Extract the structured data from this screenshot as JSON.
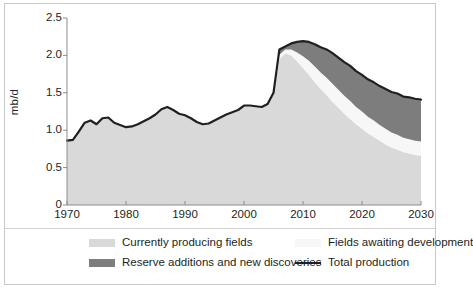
{
  "chart_data": {
    "type": "area",
    "stacked": true,
    "title": "",
    "xlabel": "",
    "ylabel": "mb/d",
    "xlim": [
      1970,
      2030
    ],
    "ylim": [
      0,
      2.5
    ],
    "xticks": [
      1970,
      1980,
      1990,
      2000,
      2010,
      2020,
      2030
    ],
    "xtick_labels": [
      "1970",
      "1980",
      "1990",
      "2000",
      "2010",
      "2020",
      "2030"
    ],
    "yticks": [
      0,
      0.5,
      1.0,
      1.5,
      2.0,
      2.5
    ],
    "ytick_labels": [
      "0",
      "0.5",
      "1.0",
      "1.5",
      "2.0",
      "2.5"
    ],
    "grid": false,
    "legend_position": "bottom",
    "colors": {
      "currently_producing_fields": "#d9d9d9",
      "fields_awaiting_development": "#f7f7f7",
      "reserve_additions_and_new_discoveries": "#7d7d7d",
      "total_production_line": "#231f20",
      "axis": "#8c8c8c",
      "frame": "#c9c9c9",
      "background": "#ffffff"
    },
    "x": [
      1970,
      1971,
      1972,
      1973,
      1974,
      1975,
      1976,
      1977,
      1978,
      1979,
      1980,
      1981,
      1982,
      1983,
      1984,
      1985,
      1986,
      1987,
      1988,
      1989,
      1990,
      1991,
      1992,
      1993,
      1994,
      1995,
      1996,
      1997,
      1998,
      1999,
      2000,
      2001,
      2002,
      2003,
      2004,
      2005,
      2006,
      2007,
      2008,
      2009,
      2010,
      2011,
      2012,
      2013,
      2014,
      2015,
      2016,
      2017,
      2018,
      2019,
      2020,
      2021,
      2022,
      2023,
      2024,
      2025,
      2026,
      2027,
      2028,
      2029,
      2030
    ],
    "series": [
      {
        "name": "Currently producing fields",
        "key": "currently_producing_fields",
        "color": "#d9d9d9",
        "values": [
          0.86,
          0.87,
          0.98,
          1.1,
          1.13,
          1.08,
          1.16,
          1.17,
          1.1,
          1.07,
          1.04,
          1.05,
          1.08,
          1.12,
          1.16,
          1.21,
          1.28,
          1.31,
          1.27,
          1.22,
          1.2,
          1.16,
          1.11,
          1.08,
          1.09,
          1.13,
          1.17,
          1.21,
          1.24,
          1.27,
          1.33,
          1.33,
          1.32,
          1.31,
          1.35,
          1.47,
          1.95,
          2.03,
          2.0,
          1.92,
          1.83,
          1.74,
          1.64,
          1.55,
          1.47,
          1.38,
          1.3,
          1.22,
          1.15,
          1.08,
          1.02,
          0.96,
          0.91,
          0.86,
          0.81,
          0.77,
          0.74,
          0.71,
          0.69,
          0.67,
          0.66
        ]
      },
      {
        "name": "Fields awaiting development",
        "key": "fields_awaiting_development",
        "color": "#f7f7f7",
        "values": [
          0,
          0,
          0,
          0,
          0,
          0,
          0,
          0,
          0,
          0,
          0,
          0,
          0,
          0,
          0,
          0,
          0,
          0,
          0,
          0,
          0,
          0,
          0,
          0,
          0,
          0,
          0,
          0,
          0,
          0,
          0,
          0,
          0,
          0,
          0,
          0.02,
          0.06,
          0.05,
          0.08,
          0.12,
          0.16,
          0.19,
          0.21,
          0.22,
          0.23,
          0.24,
          0.24,
          0.24,
          0.24,
          0.23,
          0.23,
          0.22,
          0.22,
          0.21,
          0.21,
          0.2,
          0.2,
          0.19,
          0.19,
          0.19,
          0.19
        ]
      },
      {
        "name": "Reserve additions and new discoveries",
        "key": "reserve_additions_and_new_discoveries",
        "color": "#7d7d7d",
        "values": [
          0,
          0,
          0,
          0,
          0,
          0,
          0,
          0,
          0,
          0,
          0,
          0,
          0,
          0,
          0,
          0,
          0,
          0,
          0,
          0,
          0,
          0,
          0,
          0,
          0,
          0,
          0,
          0,
          0,
          0,
          0,
          0,
          0,
          0,
          0,
          0.01,
          0.07,
          0.04,
          0.08,
          0.14,
          0.2,
          0.25,
          0.3,
          0.34,
          0.38,
          0.41,
          0.43,
          0.45,
          0.47,
          0.48,
          0.49,
          0.5,
          0.51,
          0.52,
          0.53,
          0.54,
          0.55,
          0.55,
          0.56,
          0.56,
          0.56
        ]
      }
    ],
    "total_production": {
      "name": "Total production",
      "values": [
        0.86,
        0.87,
        0.98,
        1.1,
        1.13,
        1.08,
        1.16,
        1.17,
        1.1,
        1.07,
        1.04,
        1.05,
        1.08,
        1.12,
        1.16,
        1.21,
        1.28,
        1.31,
        1.27,
        1.22,
        1.2,
        1.16,
        1.11,
        1.08,
        1.09,
        1.13,
        1.17,
        1.21,
        1.24,
        1.27,
        1.33,
        1.33,
        1.32,
        1.31,
        1.35,
        1.5,
        2.08,
        2.12,
        2.16,
        2.18,
        2.19,
        2.18,
        2.15,
        2.11,
        2.08,
        2.03,
        1.97,
        1.91,
        1.86,
        1.79,
        1.74,
        1.68,
        1.64,
        1.59,
        1.55,
        1.51,
        1.49,
        1.45,
        1.44,
        1.42,
        1.41
      ]
    }
  },
  "axis": {
    "y_title": "mb/d",
    "y_tick_labels": [
      "2.5",
      "2.0",
      "1.5",
      "1.0",
      "0.5",
      "0"
    ],
    "x_tick_labels": [
      "1970",
      "1980",
      "1990",
      "2000",
      "2010",
      "2020",
      "2030"
    ]
  },
  "legend": {
    "items": [
      {
        "label": "Currently producing fields",
        "marker": "swatch",
        "color": "#d9d9d9"
      },
      {
        "label": "Fields awaiting development",
        "marker": "swatch",
        "color": "#f7f7f7"
      },
      {
        "label": "Reserve additions and new discoveries",
        "marker": "swatch",
        "color": "#7d7d7d"
      },
      {
        "label": "Total production",
        "marker": "line",
        "color": "#231f20"
      }
    ]
  }
}
